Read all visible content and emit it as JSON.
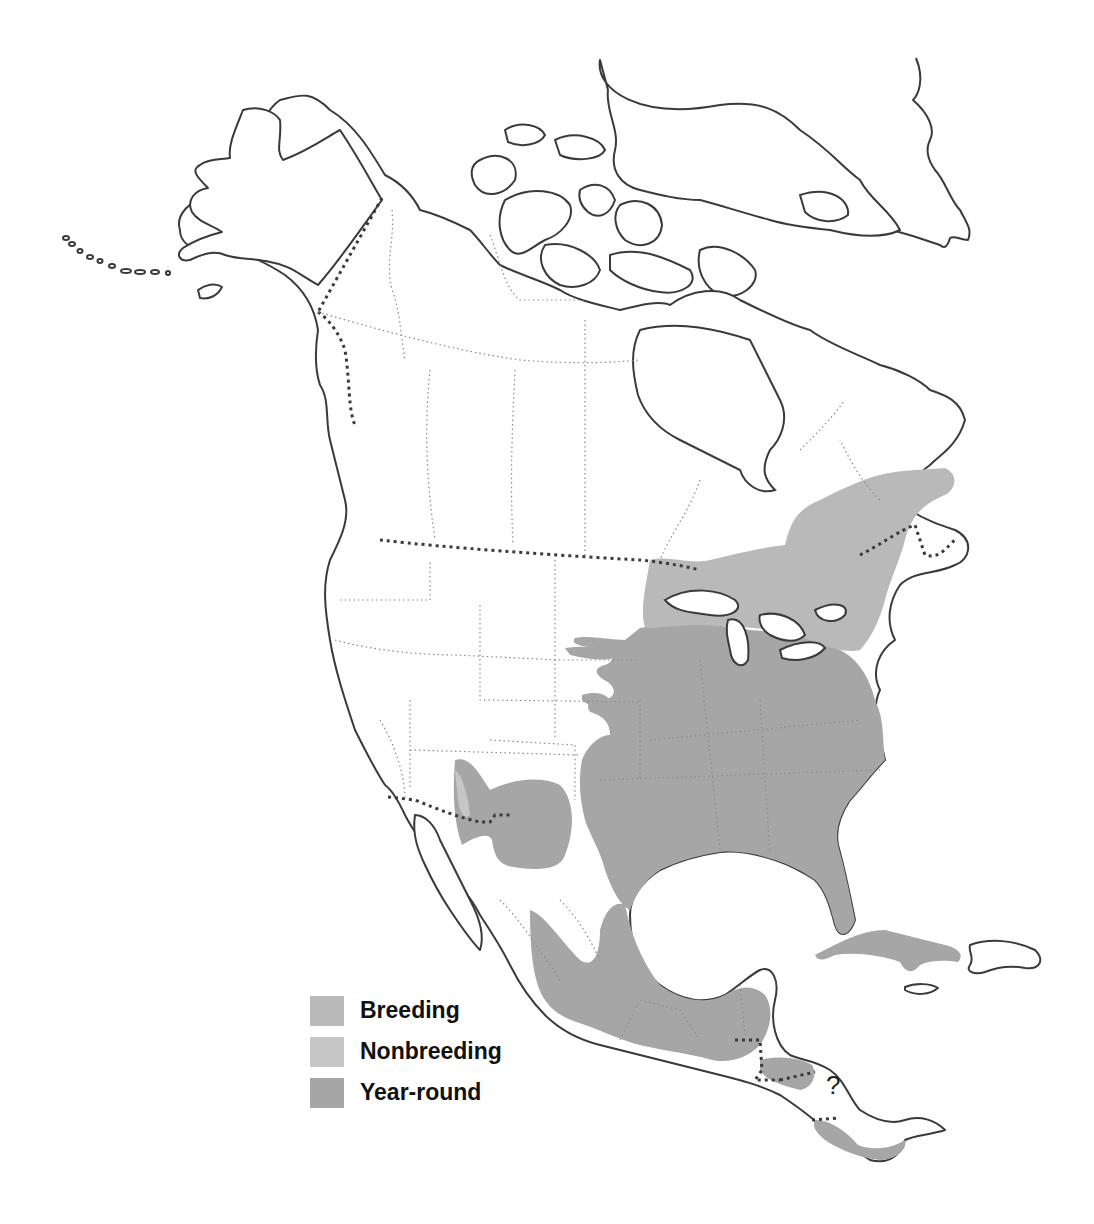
{
  "map": {
    "subject": "North America species range map",
    "region": "North America, Central America and Caribbean",
    "unknown_marker": "?",
    "range_colors": {
      "breeding": "#b9b9b9",
      "nonbreeding": "#c6c6c6",
      "year_round": "#a6a6a6"
    },
    "range_areas": {
      "breeding": "Southern Canada (Ontario, Quebec, Maritimes) and the northern Great Plains / Great Lakes states",
      "year_round": "Eastern and central United States, southwestern US (Arizona/New Mexico), eastern and central Mexico, Yucatan, Central America, Cuba",
      "nonbreeding": "Small area in southwestern Arizona"
    }
  },
  "legend": {
    "items": [
      {
        "label": "Breeding",
        "color": "#b9b9b9"
      },
      {
        "label": "Nonbreeding",
        "color": "#c6c6c6"
      },
      {
        "label": "Year-round",
        "color": "#a6a6a6"
      }
    ]
  }
}
